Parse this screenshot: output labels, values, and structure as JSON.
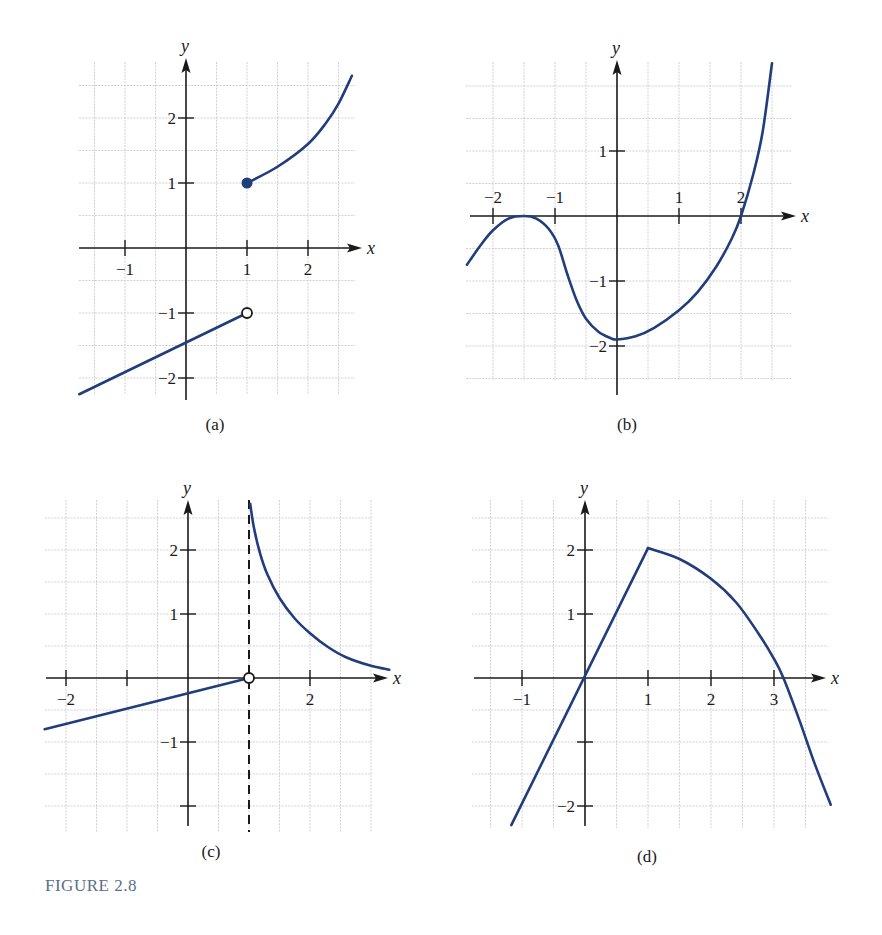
{
  "figure": {
    "caption": "FIGURE 2.8",
    "caption_color": "#5a6e8c",
    "curve_color": "#213d7c",
    "axis_color": "#1a1a1a"
  },
  "chart_data": [
    {
      "type": "line",
      "panel": "(a)",
      "xlabel": "x",
      "ylabel": "y",
      "xticks": [
        -1,
        1,
        2
      ],
      "yticks": [
        -2,
        -1,
        1,
        2
      ],
      "xlim": [
        -1.75,
        2.75
      ],
      "ylim": [
        -2.25,
        2.75
      ],
      "grid": true,
      "layout": {
        "ox": 186,
        "oy": 248,
        "ux": 61,
        "uy": 65,
        "grid_x": [
          79,
          355
        ],
        "grid_y": [
          62,
          395
        ],
        "axis_x_end": 362,
        "axis_y_top": 58,
        "axis_y_bottom": 400,
        "axis_x_start": 79,
        "label_pos": [
          215,
          430
        ]
      },
      "series": [
        {
          "name": "left piece (line)",
          "points": [
            [
              -1.75,
              -2.25
            ],
            [
              1,
              -1
            ]
          ],
          "end_marker": "open"
        },
        {
          "name": "right piece (curve)",
          "points": [
            [
              1,
              1
            ],
            [
              1.5,
              1.25
            ],
            [
              2,
              1.6
            ],
            [
              2.3,
              1.93
            ],
            [
              2.5,
              2.22
            ],
            [
              2.72,
              2.65
            ]
          ],
          "start_marker": "filled"
        }
      ],
      "annotations": [
        "open circle at (1, -1)",
        "filled dot at (1, 1)"
      ]
    },
    {
      "type": "line",
      "panel": "(b)",
      "xlabel": "x",
      "ylabel": "y",
      "xticks": [
        -2,
        -1,
        1,
        2
      ],
      "yticks": [
        -2,
        -1,
        1
      ],
      "xlim": [
        -2.4,
        2.8
      ],
      "ylim": [
        -2.5,
        2.4
      ],
      "grid": true,
      "layout": {
        "ox": 617,
        "oy": 216,
        "ux": 62,
        "uy": 65,
        "grid_x": [
          466,
          792
        ],
        "grid_y": [
          62,
          380
        ],
        "axis_x_end": 796,
        "axis_y_top": 60,
        "axis_y_bottom": 395,
        "axis_x_start": 470,
        "label_pos": [
          627,
          430
        ],
        "xtick_labels_above": true
      },
      "series": [
        {
          "name": "f(x)",
          "points": [
            [
              -2.42,
              -0.75
            ],
            [
              -2.2,
              -0.45
            ],
            [
              -2,
              -0.22
            ],
            [
              -1.75,
              -0.04
            ],
            [
              -1.5,
              0
            ],
            [
              -1.3,
              -0.04
            ],
            [
              -1.1,
              -0.2
            ],
            [
              -0.95,
              -0.45
            ],
            [
              -0.8,
              -0.9
            ],
            [
              -0.65,
              -1.3
            ],
            [
              -0.5,
              -1.58
            ],
            [
              -0.3,
              -1.78
            ],
            [
              -0.1,
              -1.88
            ],
            [
              0,
              -1.9
            ],
            [
              0.3,
              -1.85
            ],
            [
              0.6,
              -1.72
            ],
            [
              1,
              -1.45
            ],
            [
              1.3,
              -1.17
            ],
            [
              1.6,
              -0.78
            ],
            [
              1.85,
              -0.35
            ],
            [
              2,
              0
            ],
            [
              2.2,
              0.65
            ],
            [
              2.35,
              1.3
            ],
            [
              2.5,
              2.35
            ]
          ]
        }
      ],
      "annotations": [
        "touches x-axis at x = -1.5",
        "minimum about -1.9 at x = 0",
        "crosses x-axis at x = 2"
      ]
    },
    {
      "type": "line",
      "panel": "(c)",
      "xlabel": "x",
      "ylabel": "y",
      "xticks": [
        -2,
        -1,
        1,
        2
      ],
      "xtick_labels": [
        "-2",
        "",
        "",
        "2"
      ],
      "yticks": [
        -2,
        -1,
        1,
        2
      ],
      "ytick_labels": [
        "",
        "-1",
        "1",
        "2"
      ],
      "xlim": [
        -2.4,
        3.5
      ],
      "ylim": [
        -2.4,
        2.8
      ],
      "grid": true,
      "layout": {
        "ox": 188,
        "oy": 678,
        "ux": 61,
        "uy": 64,
        "grid_x": [
          45,
          372
        ],
        "grid_y": [
          500,
          832
        ],
        "axis_x_end": 388,
        "axis_y_top": 500,
        "axis_y_bottom": 826,
        "axis_x_start": 46,
        "label_pos": [
          211,
          857
        ]
      },
      "series": [
        {
          "name": "left piece (line)",
          "points": [
            [
              -2.35,
              -0.8
            ],
            [
              1,
              0
            ]
          ],
          "end_marker": "open"
        },
        {
          "name": "right piece (curve)",
          "points": [
            [
              1.02,
              2.72
            ],
            [
              1.08,
              2.35
            ],
            [
              1.18,
              1.95
            ],
            [
              1.3,
              1.62
            ],
            [
              1.5,
              1.25
            ],
            [
              1.75,
              0.93
            ],
            [
              2,
              0.7
            ],
            [
              2.3,
              0.48
            ],
            [
              2.6,
              0.32
            ],
            [
              3,
              0.19
            ],
            [
              3.3,
              0.13
            ]
          ]
        }
      ],
      "asymptote": {
        "x": 1,
        "style": "dashed"
      },
      "annotations": [
        "open circle at (1, 0)",
        "vertical asymptote x = 1"
      ]
    },
    {
      "type": "line",
      "panel": "(d)",
      "xlabel": "x",
      "ylabel": "y",
      "xticks": [
        -1,
        1,
        2,
        3
      ],
      "yticks": [
        -2,
        -1,
        1,
        2
      ],
      "ytick_labels": [
        "-2",
        "",
        "1",
        "2"
      ],
      "xlim": [
        -1.2,
        3.9
      ],
      "ylim": [
        -2.3,
        2.6
      ],
      "grid": true,
      "layout": {
        "ox": 585,
        "oy": 678,
        "ux": 63,
        "uy": 64,
        "grid_x": [
          472,
          828
        ],
        "grid_y": [
          500,
          828
        ],
        "axis_x_end": 826,
        "axis_y_top": 500,
        "axis_y_bottom": 826,
        "axis_x_start": 474,
        "label_pos": [
          647,
          862
        ]
      },
      "series": [
        {
          "name": "left piece (line)",
          "points": [
            [
              -1.17,
              -2.3
            ],
            [
              1,
              2.03
            ]
          ]
        },
        {
          "name": "right piece (curve)",
          "points": [
            [
              1,
              2.03
            ],
            [
              1.5,
              1.86
            ],
            [
              2,
              1.55
            ],
            [
              2.4,
              1.18
            ],
            [
              2.75,
              0.7
            ],
            [
              3,
              0.3
            ],
            [
              3.15,
              0
            ],
            [
              3.4,
              -0.65
            ],
            [
              3.65,
              -1.35
            ],
            [
              3.9,
              -1.98
            ]
          ]
        }
      ],
      "annotations": [
        "peak at (1, 2)",
        "crosses x-axis near x = 3.15"
      ]
    }
  ]
}
